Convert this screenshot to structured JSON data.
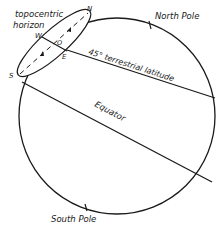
{
  "figure": {
    "type": "celestial-sphere-diagram",
    "labels": {
      "horizon_line1": "topocentric",
      "horizon_line2": "horizon",
      "north_pole": "North Pole",
      "south_pole": "South Pole",
      "latitude": "45° terrestrial latitude",
      "equator": "Equator",
      "point_n": "N",
      "point_s": "S",
      "point_w": "W",
      "point_e": "E",
      "point_o": "O"
    },
    "colors": {
      "stroke": "#1a1a1a",
      "background": "#ffffff"
    }
  }
}
